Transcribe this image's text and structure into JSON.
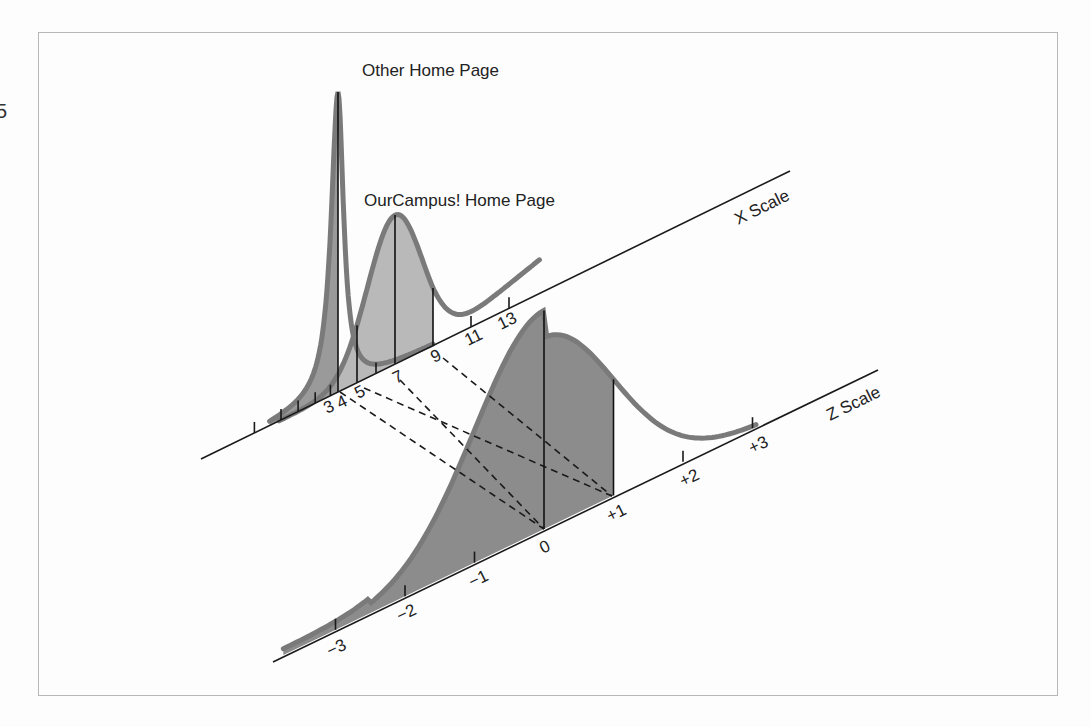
{
  "figure": {
    "edge_fragment": "5",
    "labels": {
      "other_curve": "Other Home Page",
      "ourcampus_curve": "OurCampus! Home Page",
      "x_axis": "X Scale",
      "z_axis": "Z Scale"
    },
    "x_axis": {
      "tick_labels": [
        "3",
        "4",
        "5",
        "7",
        "9",
        "11",
        "13"
      ]
    },
    "z_axis": {
      "tick_labels": [
        "−3",
        "−2",
        "−1",
        "0",
        "+1",
        "+2",
        "+3"
      ]
    },
    "colors": {
      "other_fill": "#9a9a9a",
      "ourcampus_fill": "#b9b9b9",
      "z_fill": "#8c8c8c",
      "curve_stroke": "#7a7a7a",
      "axis": "#1a1a1a"
    }
  },
  "chart_data": {
    "type": "area",
    "title": "",
    "series": [
      {
        "name": "Other Home Page",
        "axis": "X Scale",
        "mean": 4,
        "std": 1,
        "peak_at": 4,
        "marked_values": [
          4,
          5
        ]
      },
      {
        "name": "OurCampus! Home Page",
        "axis": "X Scale",
        "mean": 7,
        "std": 2,
        "peak_at": 7,
        "marked_values": [
          5,
          7,
          9
        ]
      },
      {
        "name": "Standard Normal",
        "axis": "Z Scale",
        "mean": 0,
        "std": 1,
        "marked_values": [
          0,
          1
        ]
      }
    ],
    "x_scale_ticks": [
      3,
      4,
      5,
      7,
      9,
      11,
      13
    ],
    "z_scale_ticks": [
      -3,
      -2,
      -1,
      0,
      1,
      2,
      3
    ],
    "mappings": [
      {
        "from_x": 4,
        "to_z": 0,
        "series": "Other Home Page"
      },
      {
        "from_x": 5,
        "to_z": 1,
        "series": "Other Home Page"
      },
      {
        "from_x": 7,
        "to_z": 0,
        "series": "OurCampus! Home Page"
      },
      {
        "from_x": 9,
        "to_z": 1,
        "series": "OurCampus! Home Page"
      }
    ],
    "xlabel": "X Scale",
    "ylabel": "",
    "legend": "none (inline curve labels)"
  }
}
